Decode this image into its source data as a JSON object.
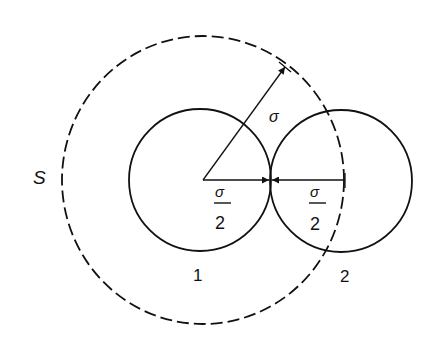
{
  "diagram": {
    "type": "geometry",
    "colors": {
      "stroke": "#111111",
      "background": "#ffffff"
    },
    "labels": {
      "sphere_surface": "S",
      "radius_exclusion": "σ",
      "radius_1_numerator": "σ",
      "radius_1_denominator": "2",
      "radius_2_numerator": "σ",
      "radius_2_denominator": "2",
      "particle_1": "1",
      "particle_2": "2"
    },
    "shapes": {
      "exclusion_circle": {
        "cx": 203,
        "cy": 180,
        "rx": 141,
        "ry": 144,
        "style": "dashed"
      },
      "particle_1_circle": {
        "cx": 200,
        "cy": 180,
        "r": 71,
        "style": "solid"
      },
      "particle_2_circle": {
        "cx": 341,
        "cy": 181,
        "r": 71,
        "style": "solid"
      },
      "radius_sigma_arrow": {
        "x1": 203,
        "y1": 180,
        "x2": 285,
        "y2": 67
      },
      "radius_half_arrow_1": {
        "x1": 203,
        "y1": 180,
        "x2": 270,
        "y2": 180
      },
      "radius_half_arrow_2": {
        "x1": 345,
        "y1": 180,
        "x2": 271,
        "y2": 180
      }
    }
  }
}
